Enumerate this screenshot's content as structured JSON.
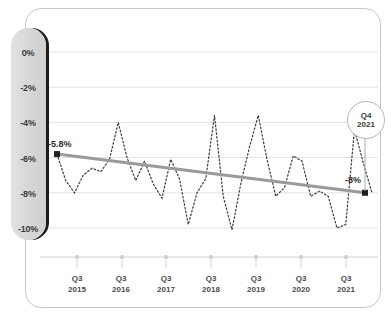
{
  "chart_data": {
    "type": "line",
    "title": "",
    "subtitle": "",
    "xlabel": "",
    "ylabel": "",
    "ylim": [
      -11.2,
      0.6
    ],
    "xlim": [
      0,
      30
    ],
    "grid": true,
    "legend": false,
    "y_ticks": [
      "0%",
      "-2%",
      "-4%",
      "-6%",
      "-8%",
      "-10%"
    ],
    "y_tick_values": [
      0,
      -2,
      -4,
      -6,
      -8,
      -10
    ],
    "x_ticks": [
      {
        "quarter": "Q3",
        "year": "2015"
      },
      {
        "quarter": "Q3",
        "year": "2016"
      },
      {
        "quarter": "Q3",
        "year": "2017"
      },
      {
        "quarter": "Q3",
        "year": "2018"
      },
      {
        "quarter": "Q3",
        "year": "2019"
      },
      {
        "quarter": "Q3",
        "year": "2020"
      },
      {
        "quarter": "Q3",
        "year": "2021"
      }
    ],
    "series": [
      {
        "name": "quarterly-values",
        "style": "dotted",
        "color": "#3a3a3a",
        "values": [
          -5.8,
          -7.3,
          -8.0,
          -7.0,
          -6.6,
          -6.8,
          -6.1,
          -4.0,
          -6.0,
          -7.3,
          -6.2,
          -7.5,
          -8.3,
          -6.1,
          -7.2,
          -9.8,
          -8.0,
          -7.2,
          -3.6,
          -8.2,
          -10.1,
          -7.5,
          -5.4,
          -3.6,
          -6.1,
          -8.2,
          -7.7,
          -5.9,
          -6.2,
          -8.2,
          -7.9,
          -8.2,
          -10.0,
          -9.8,
          -4.4,
          -6.3,
          -8.0
        ]
      },
      {
        "name": "trend-line",
        "style": "solid",
        "color": "#9a9a9a",
        "start_value": -5.8,
        "end_value": -8.0
      }
    ],
    "annotations": [
      {
        "name": "start-label",
        "text": "-5.8%",
        "x": 57,
        "y": 155
      },
      {
        "name": "end-label",
        "text": "-8%",
        "x": 365,
        "y": 190
      }
    ],
    "callout": {
      "line1": "Q4",
      "line2": "2021"
    }
  },
  "axis": {
    "y_labels": [
      "0%",
      "-2%",
      "-4%",
      "-6%",
      "-8%",
      "-10%"
    ],
    "x_labels": [
      {
        "q": "Q3",
        "y": "2015"
      },
      {
        "q": "Q3",
        "y": "2016"
      },
      {
        "q": "Q3",
        "y": "2017"
      },
      {
        "q": "Q3",
        "y": "2018"
      },
      {
        "q": "Q3",
        "y": "2019"
      },
      {
        "q": "Q3",
        "y": "2020"
      },
      {
        "q": "Q3",
        "y": "2021"
      }
    ]
  },
  "labels": {
    "start": "-5.8%",
    "end": "-8%"
  },
  "callout": {
    "quarter": "Q4",
    "year": "2021"
  },
  "colors": {
    "grid": "#e3e3e3",
    "series": "#3a3a3a",
    "trend": "#9a9a9a",
    "band_light": "#e2e2e2",
    "band_dark": "#cfcfcf",
    "band_shadow": "#1b1b1b",
    "frame": "#c9c9c9",
    "text": "#3b3b3b"
  }
}
